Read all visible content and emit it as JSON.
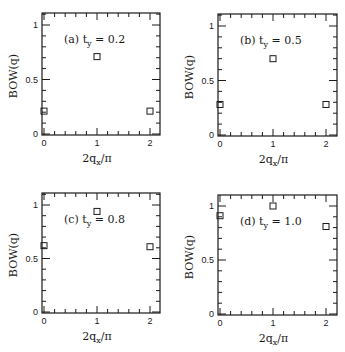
{
  "chart_data": [
    {
      "type": "scatter",
      "panel": "a",
      "annotation": "(a) t_y = 0.2",
      "annotation_parts": {
        "prefix": "(a) t",
        "sub": "y",
        "suffix": " = 0.2"
      },
      "xlabel": "2q_x/π",
      "xlabel_parts": {
        "prefix": "2q",
        "sub": "x",
        "suffix": "/π"
      },
      "ylabel": "BOW(q)",
      "x": [
        0,
        1,
        2
      ],
      "y": [
        0.21,
        0.71,
        0.21
      ],
      "marker": "open-square",
      "xlim": [
        -0.05,
        2.2
      ],
      "ylim": [
        0,
        1.1
      ],
      "xticks": [
        0,
        1,
        2
      ],
      "yticks": [
        0,
        0.5,
        1
      ],
      "xtick_labels": [
        "0",
        "1",
        "2"
      ],
      "ytick_labels": [
        "0",
        "0.5",
        "1"
      ],
      "grid": false,
      "legend": null
    },
    {
      "type": "scatter",
      "panel": "b",
      "annotation": "(b) t_y = 0.5",
      "annotation_parts": {
        "prefix": "(b) t",
        "sub": "y",
        "suffix": " = 0.5"
      },
      "xlabel": "2q_x/π",
      "xlabel_parts": {
        "prefix": "2q",
        "sub": "x",
        "suffix": "/π"
      },
      "ylabel": "BOW(q)",
      "x": [
        0,
        1,
        2
      ],
      "y": [
        0.28,
        0.7,
        0.28
      ],
      "marker": "open-square",
      "xlim": [
        -0.05,
        2.2
      ],
      "ylim": [
        0,
        1.1
      ],
      "xticks": [
        0,
        1,
        2
      ],
      "yticks": [
        0,
        0.5,
        1
      ],
      "xtick_labels": [
        "0",
        "1",
        "2"
      ],
      "ytick_labels": [
        "0",
        "0.5",
        "1"
      ],
      "grid": false,
      "legend": null
    },
    {
      "type": "scatter",
      "panel": "c",
      "annotation": "(c) t_y = 0.8",
      "annotation_parts": {
        "prefix": "(c) t",
        "sub": "y",
        "suffix": " = 0.8"
      },
      "xlabel": "2q_x/π",
      "xlabel_parts": {
        "prefix": "2q",
        "sub": "x",
        "suffix": "/π"
      },
      "ylabel": "BOW(q)",
      "x": [
        0,
        1,
        2
      ],
      "y": [
        0.62,
        0.94,
        0.61
      ],
      "marker": "open-square",
      "xlim": [
        -0.05,
        2.2
      ],
      "ylim": [
        0,
        1.1
      ],
      "xticks": [
        0,
        1,
        2
      ],
      "yticks": [
        0,
        0.5,
        1
      ],
      "xtick_labels": [
        "0",
        "1",
        "2"
      ],
      "ytick_labels": [
        "0",
        "0.5",
        "1"
      ],
      "grid": false,
      "legend": null
    },
    {
      "type": "scatter",
      "panel": "d",
      "annotation": "(d) t_y = 1.0",
      "annotation_parts": {
        "prefix": "(d) t",
        "sub": "y",
        "suffix": " = 1.0"
      },
      "xlabel": "2q_x/π",
      "xlabel_parts": {
        "prefix": "2q",
        "sub": "x",
        "suffix": "/π"
      },
      "ylabel": "BOW(q)",
      "x": [
        0,
        1,
        2
      ],
      "y": [
        0.91,
        1.0,
        0.81
      ],
      "marker": "open-square",
      "xlim": [
        -0.05,
        2.2
      ],
      "ylim": [
        0,
        1.1
      ],
      "xticks": [
        0,
        1,
        2
      ],
      "yticks": [
        0,
        0.5,
        1
      ],
      "xtick_labels": [
        "0",
        "1",
        "2"
      ],
      "ytick_labels": [
        "0",
        "0.5",
        "1"
      ],
      "grid": false,
      "legend": null
    }
  ],
  "layout": {
    "panels": [
      {
        "left": 42,
        "top": 13,
        "right": 160,
        "bottom": 135,
        "x0px": 44,
        "x2px": 150,
        "y0px": 134,
        "y1px": 25
      },
      {
        "left": 218,
        "top": 14,
        "right": 337,
        "bottom": 136,
        "x0px": 220,
        "x2px": 326,
        "y0px": 135,
        "y1px": 26
      },
      {
        "left": 42,
        "top": 193,
        "right": 160,
        "bottom": 313,
        "x0px": 44,
        "x2px": 150,
        "y0px": 312,
        "y1px": 205
      },
      {
        "left": 218,
        "top": 195,
        "right": 337,
        "bottom": 315,
        "x0px": 220,
        "x2px": 326,
        "y0px": 314,
        "y1px": 206
      }
    ],
    "ink_color": "#1a1a1a",
    "background": "#ffffff"
  }
}
